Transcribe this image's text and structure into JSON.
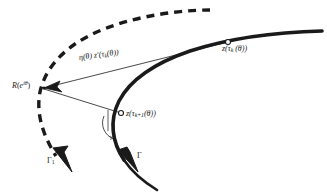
{
  "figure": {
    "type": "mathematical-diagram",
    "background": "#ffffff",
    "width": 327,
    "height": 196,
    "ink_color": "#1a1a1a"
  },
  "labels": {
    "vertex_point": {
      "base": "R",
      "arg_open": "(",
      "arg_base": "e",
      "arg_exp": "iθ",
      "arg_close": ")",
      "full": "R(e^{iθ})"
    },
    "vector": {
      "full": "η(θ) z′(τ",
      "sub": "k",
      "tail": "(θ))",
      "display": "η(θ) z′(τ_k(θ))"
    },
    "point_k": {
      "head": "z(τ",
      "sub": "k",
      "tail": " (θ))",
      "display": "z(τ_k(θ))"
    },
    "point_k1": {
      "head": "z(τ",
      "sub": "k+1",
      "tail": "(θ))",
      "display": "z(τ_{k+1}(θ))"
    },
    "curve_dashed": {
      "base": "Γ",
      "sub": "1",
      "display": "Γ₁"
    },
    "curve_solid": {
      "base": "Γ",
      "display": "Γ"
    },
    "angle": {
      "display": "γ"
    }
  },
  "elements": {
    "dashed_curve_name": "gamma-one-dashed-curve",
    "solid_curve_name": "gamma-solid-curve",
    "chord_upper_name": "chord-to-z-tau-k",
    "chord_lower_name": "chord-to-z-tau-k-plus-1",
    "marker_k_name": "marker-z-tau-k",
    "marker_k1_name": "marker-z-tau-k-plus-1",
    "vertex_marker_name": "marker-R-e-i-theta",
    "angle_arc_name": "angle-arc",
    "arrow_dashed_name": "arrowhead-gamma-one",
    "arrow_solid_name": "arrowhead-gamma",
    "arrow_vector_name": "arrowhead-vector"
  }
}
